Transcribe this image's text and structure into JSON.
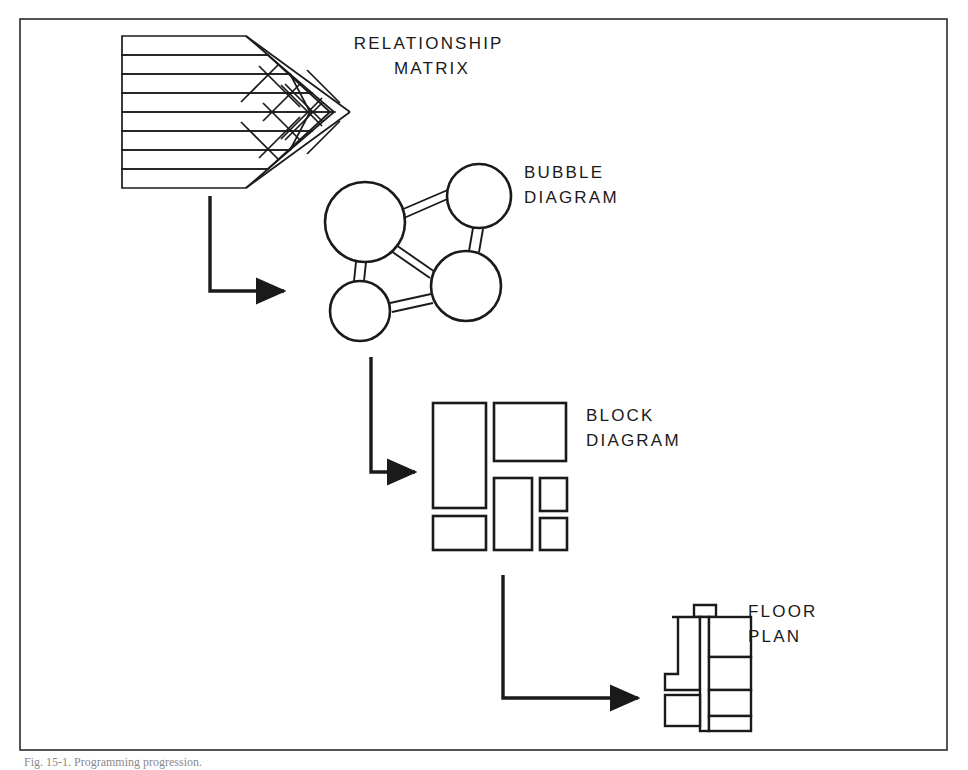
{
  "figure": {
    "domain": "diagram",
    "background_color": "#ffffff",
    "ink_color": "#1a1a1a",
    "border": {
      "x": 20,
      "y": 19,
      "width": 927,
      "height": 731,
      "stroke_width": 1.6
    }
  },
  "stages": [
    {
      "id": "relationship-matrix",
      "label_lines": [
        "RELATIONSHIP",
        "MATRIX"
      ],
      "label_x": 432,
      "label_y": 49,
      "label_align": "middle",
      "rows": 8,
      "row_band": {
        "x": 122,
        "y": 36,
        "width": 146,
        "height": 151
      },
      "diagonal_cells": 8
    },
    {
      "id": "bubble-diagram",
      "label_lines": [
        "BUBBLE",
        "DIAGRAM"
      ],
      "label_x": 524,
      "label_y": 178,
      "label_align": "start",
      "bubbles": [
        {
          "cx": 365,
          "cy": 222,
          "r": 40
        },
        {
          "cx": 479,
          "cy": 196,
          "r": 32
        },
        {
          "cx": 466,
          "cy": 286,
          "r": 35
        },
        {
          "cx": 360,
          "cy": 311,
          "r": 30
        }
      ],
      "links": [
        [
          0,
          1
        ],
        [
          0,
          2
        ],
        [
          0,
          3
        ],
        [
          1,
          2
        ],
        [
          2,
          3
        ]
      ]
    },
    {
      "id": "block-diagram",
      "label_lines": [
        "BLOCK",
        "DIAGRAM"
      ],
      "label_x": 586,
      "label_y": 421,
      "label_align": "start",
      "blocks": [
        {
          "x": 433,
          "y": 403,
          "width": 53,
          "height": 105
        },
        {
          "x": 494,
          "y": 403,
          "width": 72,
          "height": 58
        },
        {
          "x": 494,
          "y": 478,
          "width": 38,
          "height": 72
        },
        {
          "x": 540,
          "y": 478,
          "width": 27,
          "height": 33
        },
        {
          "x": 433,
          "y": 516,
          "width": 53,
          "height": 34
        },
        {
          "x": 540,
          "y": 518,
          "width": 27,
          "height": 32
        }
      ]
    },
    {
      "id": "floor-plan",
      "label_lines": [
        "FLOOR",
        "PLAN"
      ],
      "label_x": 748,
      "label_y": 617,
      "label_align": "start",
      "bounds": {
        "x": 665,
        "y": 604,
        "width": 86,
        "height": 127
      }
    }
  ],
  "arrows": [
    {
      "id": "arrow-matrix-to-bubble",
      "x1": 210,
      "y1": 196,
      "x2": 210,
      "y2": 291,
      "x3": 293,
      "y3": 291
    },
    {
      "id": "arrow-bubble-to-block",
      "x1": 371,
      "y1": 357,
      "x2": 371,
      "y2": 472,
      "x3": 424,
      "y3": 472
    },
    {
      "id": "arrow-block-to-floor",
      "x1": 503,
      "y1": 575,
      "x2": 503,
      "y2": 698,
      "x3": 647,
      "y3": 698
    }
  ],
  "caption": {
    "text": "Fig. 15-1. Programming progression.",
    "x": 24,
    "y": 766
  }
}
